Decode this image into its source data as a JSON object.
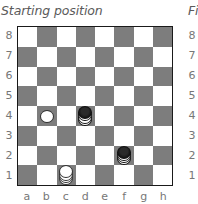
{
  "diagram": {
    "title": "Starting position",
    "next_title_partial": "Fi",
    "ranks": [
      "8",
      "7",
      "6",
      "5",
      "4",
      "3",
      "2",
      "1"
    ],
    "files": [
      "a",
      "b",
      "c",
      "d",
      "e",
      "f",
      "g",
      "h"
    ],
    "colors": {
      "light_square": "#ffffff",
      "dark_square": "#7d7d7d",
      "border": "#1a1a1a"
    },
    "pieces": [
      {
        "square": "b4",
        "color": "white",
        "stack": 1
      },
      {
        "square": "d4",
        "color": "black",
        "stack": 4
      },
      {
        "square": "f2",
        "color": "black",
        "stack": 4
      },
      {
        "square": "c1",
        "color": "white",
        "stack": 4
      }
    ]
  }
}
